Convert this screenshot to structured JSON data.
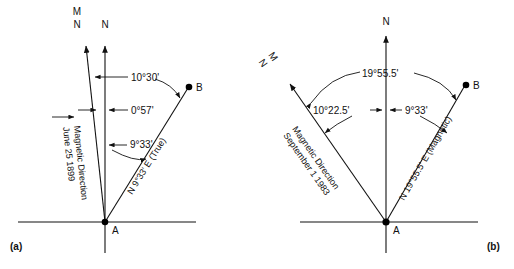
{
  "figure": {
    "title": "",
    "panels": [
      {
        "id": "a",
        "panel_label": "(a)",
        "vertex_label": "A",
        "target_label": "B",
        "magnetic_north_label_line1": "M",
        "magnetic_north_label_line2": "N",
        "true_north_label": "N",
        "magnetic_direction_line1": "Magnetic Direction",
        "magnetic_direction_line2": "June 25 1899",
        "bearing_label": "N 9°33' E (True)",
        "angles": [
          {
            "name": "mn-to-b",
            "value": "10°30'"
          },
          {
            "name": "mn-to-true-n",
            "value": "0°57'"
          },
          {
            "name": "true-n-to-b",
            "value": "9°33'"
          }
        ]
      },
      {
        "id": "b",
        "panel_label": "(b)",
        "vertex_label": "A",
        "target_label": "B",
        "magnetic_north_label_line1": "M",
        "magnetic_north_label_line2": "N",
        "true_north_label": "N",
        "magnetic_direction_line1": "Magnetic Direction",
        "magnetic_direction_line2": "September 1 1983",
        "bearing_label": "N 19°55.5' E (Magnetic)",
        "angles": [
          {
            "name": "mn-to-b",
            "value": "19°55.5'"
          },
          {
            "name": "mn-to-true-n",
            "value": "10°22.5'"
          },
          {
            "name": "true-n-to-b",
            "value": "9°33'"
          }
        ]
      }
    ]
  },
  "colors": {
    "ink": "#111111",
    "background": "#ffffff"
  }
}
